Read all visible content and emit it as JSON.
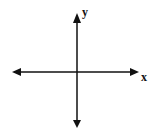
{
  "diagram": {
    "type": "coordinate-axes",
    "x_axis_label": "x",
    "y_axis_label": "y",
    "line_color": "#111111",
    "background": "#ffffff"
  }
}
